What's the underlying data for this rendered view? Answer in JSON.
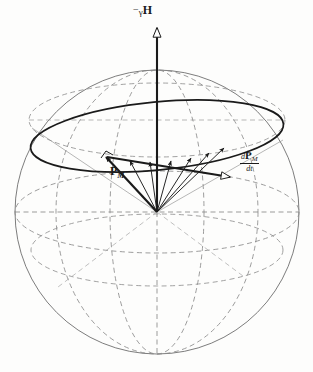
{
  "figure": {
    "background_color": "#fdfdfc",
    "ink_color": "#1a1a1a",
    "dashed_color": "#8a8a8a",
    "thin_color": "#6e6e6e",
    "labels": {
      "field_axis": {
        "minus": "−",
        "gamma": "γ",
        "H": "H",
        "full": "−γH"
      },
      "moment_vector": {
        "symbol": "P",
        "subscript": "M",
        "full": "Pₘ"
      },
      "derivative_vector": {
        "numerator_d": "d",
        "numerator_P": "P",
        "numerator_sub": "M",
        "denominator": "dt",
        "full": "dPₘ/dt"
      }
    },
    "geometry": {
      "sphere": {
        "cx": 157,
        "cy": 212,
        "r": 142
      },
      "field_axis": {
        "x": 157,
        "y_top": 26,
        "y_bottom": 212,
        "arrow": "up-hollow"
      },
      "cone_base_ellipse": {
        "cx": 157,
        "cy": 136,
        "rx": 127,
        "ry": 35,
        "rotation_deg": -5.5
      },
      "equator_ellipse": {
        "cx": 157,
        "cy": 212,
        "rx": 142,
        "ry": 40
      },
      "upper_latitude_ellipse": {
        "cx": 157,
        "cy": 120,
        "rx": 127,
        "ry": 36
      },
      "lower_latitude_ellipse": {
        "cx": 157,
        "cy": 248,
        "rx": 125,
        "ry": 36
      },
      "meridian_front": {
        "cx": 157,
        "cy": 212,
        "rx": 46,
        "ry": 142
      },
      "meridian_back": {
        "cx": 157,
        "cy": 212,
        "rx": 101,
        "ry": 142
      },
      "vector_count": 7,
      "leading_vector_label": "Pₘ",
      "tangent_vector_label": "dPₘ/dt",
      "right_angle_marker": true
    },
    "vector_tips": [
      {
        "x": 105,
        "y": 156,
        "bold": true,
        "name": "p-m-vector"
      },
      {
        "x": 129,
        "y": 160,
        "bold": false,
        "name": "precession-vector-2"
      },
      {
        "x": 150,
        "y": 161,
        "bold": false,
        "name": "precession-vector-3"
      },
      {
        "x": 170,
        "y": 160,
        "bold": false,
        "name": "precession-vector-4"
      },
      {
        "x": 190,
        "y": 157,
        "bold": false,
        "name": "precession-vector-5"
      },
      {
        "x": 208,
        "y": 152,
        "bold": false,
        "name": "precession-vector-6"
      },
      {
        "x": 223,
        "y": 147,
        "bold": false,
        "name": "precession-vector-7"
      }
    ],
    "tangent_vector": {
      "x1": 105,
      "y1": 156,
      "x2": 235,
      "y2": 178,
      "arrow": "hollow"
    }
  }
}
